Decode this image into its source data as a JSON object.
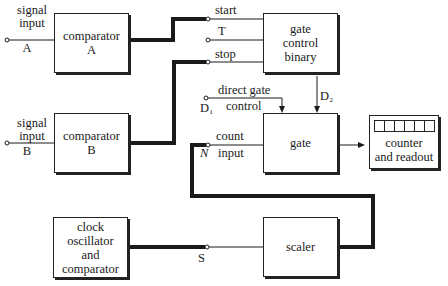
{
  "diagram": {
    "blocks": {
      "comparator_a": "comparator\nA",
      "comparator_b": "comparator\nB",
      "gate_control": "gate\ncontrol\nbinary",
      "gate": "gate",
      "counter": "counter\nand readout",
      "clock": "clock\noscillator\nand\ncomparator",
      "scaler": "scaler"
    },
    "labels": {
      "signal_input_a": "signal\ninput",
      "a": "A",
      "signal_input_b": "signal\ninput",
      "b": "B",
      "start": "start",
      "t": "T",
      "stop": "stop",
      "direct_gate": "direct gate",
      "control": "control",
      "d1": "D₁",
      "d2": "D₂",
      "count": "count",
      "input": "input",
      "n": "N",
      "s": "S"
    },
    "counter_digits": 6
  }
}
